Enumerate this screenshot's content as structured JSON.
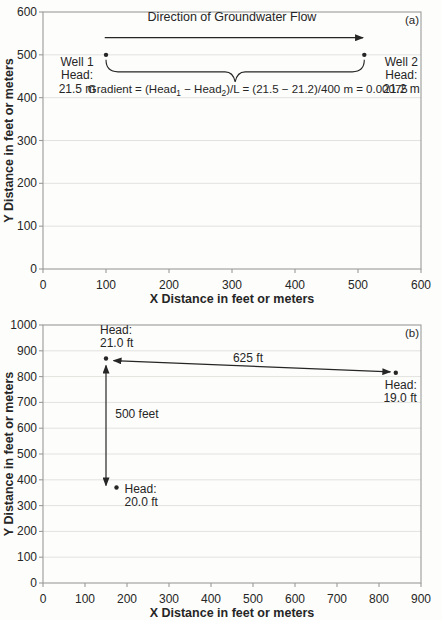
{
  "page": {
    "background": "#fdfdfb",
    "ink": "#262626",
    "axis_color": "#9b9b9b",
    "grid_color": "#e2e2e0"
  },
  "chart_data": [
    {
      "type": "scatter",
      "panel_label": "(a)",
      "title": "Direction of Groundwater Flow",
      "xlabel": "X Distance in feet or meters",
      "ylabel": "Y Distance in feet or meters",
      "xlim": [
        0,
        600
      ],
      "ylim": [
        0,
        600
      ],
      "xticks": [
        0,
        100,
        200,
        300,
        400,
        500,
        600
      ],
      "yticks": [
        0,
        100,
        200,
        300,
        400,
        500,
        600
      ],
      "grid": "horizontal",
      "legend": "none",
      "points": [
        {
          "x": 100,
          "y": 500,
          "label": [
            "Well 1",
            "Head:",
            "21.5 m"
          ],
          "anchor": "middle",
          "dx": -29,
          "dy": 11
        },
        {
          "x": 510,
          "y": 500,
          "label": [
            "Well 2",
            "Head:",
            "21.2 m"
          ],
          "anchor": "middle",
          "dx": 37,
          "dy": 11
        }
      ],
      "annotations": [
        {
          "kind": "title",
          "x": 300,
          "y": 579,
          "anchor": "middle",
          "size": 12.5,
          "name": "flow-direction-title"
        },
        {
          "kind": "arrow",
          "from": [
            98,
            540
          ],
          "to": [
            508,
            540
          ],
          "heads": "end",
          "name": "flow-direction-arrow"
        },
        {
          "kind": "brace",
          "from": [
            100,
            500
          ],
          "to": [
            510,
            500
          ],
          "name": "gradient-brace"
        },
        {
          "kind": "text",
          "x": 325,
          "y": 410,
          "text": "Gradient = (Head₁ − Head₂)/L = (21.5 − 21.2)/400 m = 0.00075",
          "anchor": "middle",
          "size": 11.5,
          "name": "gradient-equation"
        }
      ]
    },
    {
      "type": "scatter",
      "panel_label": "(b)",
      "title": "",
      "xlabel": "X Distance in feet or meters",
      "ylabel": "Y Distance in feet or meters",
      "xlim": [
        0,
        900
      ],
      "ylim": [
        0,
        1000
      ],
      "xticks": [
        0,
        100,
        200,
        300,
        400,
        500,
        600,
        700,
        800,
        900
      ],
      "yticks": [
        0,
        100,
        200,
        300,
        400,
        500,
        600,
        700,
        800,
        900,
        1000
      ],
      "grid": "horizontal",
      "legend": "none",
      "points": [
        {
          "x": 150,
          "y": 870,
          "label": [
            "Head:",
            "21.0 ft"
          ],
          "anchor": "start",
          "dx": -6,
          "dy": -25
        },
        {
          "x": 840,
          "y": 815,
          "label": [
            "Head:",
            "19.0 ft"
          ],
          "anchor": "end",
          "dx": 21,
          "dy": 16
        },
        {
          "x": 175,
          "y": 370,
          "label": [
            "Head:",
            "20.0 ft"
          ],
          "anchor": "start",
          "dx": 8,
          "dy": 5
        }
      ],
      "annotations": [
        {
          "kind": "arrow",
          "from": [
            168,
            862
          ],
          "to": [
            827,
            818
          ],
          "heads": "both",
          "label": "625 ft",
          "label_at": [
            488,
            857
          ],
          "label_anchor": "middle",
          "name": "distance-arrow-625"
        },
        {
          "kind": "arrow",
          "from": [
            150,
            843
          ],
          "to": [
            150,
            378
          ],
          "heads": "both",
          "label": "500 feet",
          "label_at": [
            172,
            638
          ],
          "label_anchor": "start",
          "name": "distance-arrow-500"
        }
      ]
    }
  ]
}
